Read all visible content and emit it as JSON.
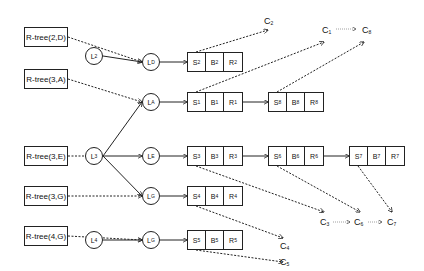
{
  "diagram": {
    "rtrees": [
      {
        "id": "rt_2D",
        "label": "R-tree(2,D)"
      },
      {
        "id": "rt_3A",
        "label": "R-tree(3,A)"
      },
      {
        "id": "rt_3E",
        "label": "R-tree(3,E)"
      },
      {
        "id": "rt_3G",
        "label": "R-tree(3,G)"
      },
      {
        "id": "rt_4G",
        "label": "R-tree(4,G)"
      }
    ],
    "lnodes": [
      {
        "id": "L2",
        "base": "L",
        "sub": "2"
      },
      {
        "id": "LD",
        "base": "L",
        "sub": "D"
      },
      {
        "id": "LA",
        "base": "L",
        "sub": "A"
      },
      {
        "id": "L3",
        "base": "L",
        "sub": "3"
      },
      {
        "id": "LE",
        "base": "L",
        "sub": "E"
      },
      {
        "id": "LG",
        "base": "L",
        "sub": "G"
      },
      {
        "id": "L4",
        "base": "L",
        "sub": "4"
      },
      {
        "id": "LG2",
        "base": "L",
        "sub": "G"
      }
    ],
    "blocks": [
      {
        "id": "blk2",
        "cells": [
          {
            "b": "S",
            "s": "2"
          },
          {
            "b": "B",
            "s": "2"
          },
          {
            "b": "R",
            "s": "2"
          }
        ]
      },
      {
        "id": "blk1",
        "cells": [
          {
            "b": "S",
            "s": "1"
          },
          {
            "b": "B",
            "s": "1"
          },
          {
            "b": "R",
            "s": "1"
          }
        ]
      },
      {
        "id": "blk8",
        "cells": [
          {
            "b": "S",
            "s": "8"
          },
          {
            "b": "B",
            "s": "8"
          },
          {
            "b": "R",
            "s": "8"
          }
        ]
      },
      {
        "id": "blk3",
        "cells": [
          {
            "b": "S",
            "s": "3"
          },
          {
            "b": "B",
            "s": "3"
          },
          {
            "b": "R",
            "s": "3"
          }
        ]
      },
      {
        "id": "blk6",
        "cells": [
          {
            "b": "S",
            "s": "6"
          },
          {
            "b": "B",
            "s": "6"
          },
          {
            "b": "R",
            "s": "6"
          }
        ]
      },
      {
        "id": "blk7",
        "cells": [
          {
            "b": "S",
            "s": "7"
          },
          {
            "b": "B",
            "s": "7"
          },
          {
            "b": "R",
            "s": "7"
          }
        ]
      },
      {
        "id": "blk4",
        "cells": [
          {
            "b": "S",
            "s": "4"
          },
          {
            "b": "B",
            "s": "4"
          },
          {
            "b": "R",
            "s": "4"
          }
        ]
      },
      {
        "id": "blk5",
        "cells": [
          {
            "b": "S",
            "s": "5"
          },
          {
            "b": "B",
            "s": "5"
          },
          {
            "b": "R",
            "s": "5"
          }
        ]
      }
    ],
    "cnodes": [
      {
        "id": "C2",
        "base": "C",
        "sub": "2"
      },
      {
        "id": "C1",
        "base": "C",
        "sub": "1"
      },
      {
        "id": "C8",
        "base": "C",
        "sub": "8"
      },
      {
        "id": "C3",
        "base": "C",
        "sub": "3"
      },
      {
        "id": "C6",
        "base": "C",
        "sub": "6"
      },
      {
        "id": "C7",
        "base": "C",
        "sub": "7"
      },
      {
        "id": "C4",
        "base": "C",
        "sub": "4"
      },
      {
        "id": "C5",
        "base": "C",
        "sub": "5"
      }
    ],
    "colors": {
      "line": "#222222",
      "background": "#ffffff"
    }
  }
}
